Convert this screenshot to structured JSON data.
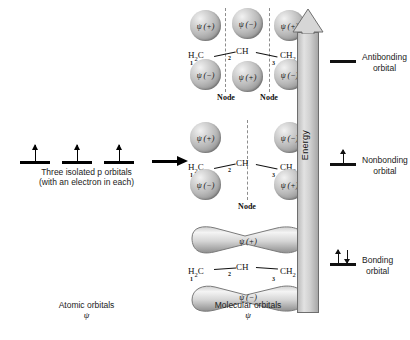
{
  "figure": {
    "atomic_side": {
      "caption_line1": "Three isolated p orbitals",
      "caption_line2": "(with an electron in each)",
      "footer_label": "Atomic orbitals",
      "footer_symbol": "ψ",
      "orbital_count": 3,
      "electrons_per_orbital": 1
    },
    "molecular_side": {
      "footer_label": "Molecular orbitals",
      "footer_symbol": "ψ"
    },
    "flow_arrow": "→",
    "energy_axis": {
      "label": "Energy",
      "direction": "up"
    },
    "skeleton": {
      "atom1": "H₂C",
      "atom2": "CH",
      "atom3": "CH₂",
      "num1": "1",
      "num2": "2",
      "num3": "3"
    },
    "node_label": "Node",
    "orbitals": [
      {
        "id": "antibonding",
        "level_label_line1": "Antibonding",
        "level_label_line2": "orbital",
        "electrons": 0,
        "electron_symbols": "",
        "node_count": 2,
        "lobe_shape": "spheres",
        "top_signs": [
          "ψ (+)",
          "ψ (−)",
          "ψ (+)"
        ],
        "bottom_signs": [
          "ψ (−)",
          "ψ (+)",
          "ψ (−)"
        ]
      },
      {
        "id": "nonbonding",
        "level_label_line1": "Nonbonding",
        "level_label_line2": "orbital",
        "electrons": 1,
        "electron_symbols": "↑",
        "node_count": 1,
        "lobe_shape": "spheres",
        "top_signs": [
          "ψ (+)",
          "",
          "ψ (−)"
        ],
        "bottom_signs": [
          "ψ (−)",
          "",
          "ψ (+)"
        ]
      },
      {
        "id": "bonding",
        "level_label_line1": "Bonding",
        "level_label_line2": "orbital",
        "electrons": 2,
        "electron_symbols": "↑↓",
        "node_count": 0,
        "lobe_shape": "continuous-bent-lobes",
        "top_signs": [
          "ψ (+)"
        ],
        "bottom_signs": [
          "ψ (−)"
        ]
      }
    ],
    "colors": {
      "sphere_light": "#f2f2f2",
      "sphere_dark": "#7b7b7b",
      "energy_arrow_fill": "#cfcfcf",
      "energy_arrow_stroke": "#6e6e6e",
      "node_line": "#8d8d8d",
      "ink": "#111111"
    }
  }
}
